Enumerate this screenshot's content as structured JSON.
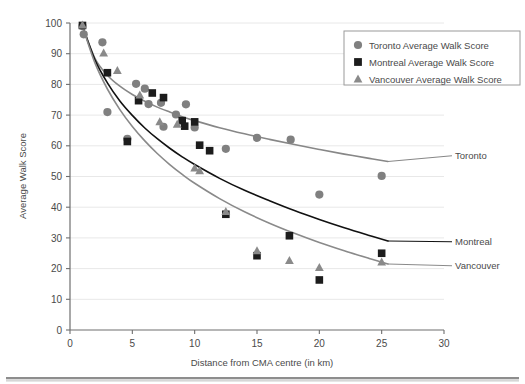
{
  "chart_data": {
    "type": "scatter",
    "title": "",
    "xlabel": "Distance from CMA centre (in km)",
    "ylabel": "Average Walk Score",
    "xlim": [
      0,
      30
    ],
    "ylim": [
      0,
      100
    ],
    "xticks": [
      0,
      5,
      10,
      15,
      20,
      25,
      30
    ],
    "yticks": [
      0,
      10,
      20,
      30,
      40,
      50,
      60,
      70,
      80,
      90,
      100
    ],
    "grid": "horizontal",
    "legend_position": "top-right",
    "legend": [
      {
        "label": "Toronto Average Walk Score",
        "marker": "circle",
        "color": "#808080"
      },
      {
        "label": "Montreal Average Walk Score",
        "marker": "square",
        "color": "#1c1c1c"
      },
      {
        "label": "Vancouver Average Walk Score",
        "marker": "triangle",
        "color": "#8a8a8a"
      }
    ],
    "series": [
      {
        "name": "Toronto Average Walk Score",
        "marker": "circle",
        "color": "#808080",
        "trend_color": "#878787",
        "end_label": "Toronto",
        "points": [
          [
            1.0,
            99.0
          ],
          [
            1.1,
            96.3
          ],
          [
            2.6,
            93.7
          ],
          [
            3.0,
            71.0
          ],
          [
            4.6,
            62.3
          ],
          [
            5.3,
            80.2
          ],
          [
            6.0,
            78.6
          ],
          [
            6.3,
            73.6
          ],
          [
            7.3,
            74.0
          ],
          [
            7.5,
            66.2
          ],
          [
            8.5,
            70.2
          ],
          [
            9.3,
            73.5
          ],
          [
            10.0,
            66.0
          ],
          [
            12.5,
            59.0
          ],
          [
            15.0,
            62.6
          ],
          [
            17.7,
            62.0
          ],
          [
            20.0,
            44.1
          ],
          [
            25.0,
            50.2
          ]
        ],
        "trend": [
          [
            1.0,
            99.0
          ],
          [
            2.0,
            88.5
          ],
          [
            3.0,
            83.0
          ],
          [
            4.0,
            79.4
          ],
          [
            5.0,
            76.7
          ],
          [
            6.0,
            74.5
          ],
          [
            7.0,
            72.6
          ],
          [
            8.0,
            71.0
          ],
          [
            9.0,
            69.5
          ],
          [
            10.0,
            68.2
          ],
          [
            12.0,
            65.9
          ],
          [
            14.0,
            63.9
          ],
          [
            16.0,
            62.1
          ],
          [
            18.0,
            60.4
          ],
          [
            20.0,
            58.8
          ],
          [
            22.0,
            57.3
          ],
          [
            24.0,
            55.9
          ],
          [
            25.5,
            54.9
          ]
        ]
      },
      {
        "name": "Montreal Average Walk Score",
        "marker": "square",
        "color": "#1c1c1c",
        "trend_color": "#111111",
        "end_label": "Montreal",
        "points": [
          [
            1.0,
            99.2
          ],
          [
            3.0,
            83.8
          ],
          [
            4.6,
            61.4
          ],
          [
            5.5,
            74.7
          ],
          [
            6.6,
            77.2
          ],
          [
            7.5,
            75.7
          ],
          [
            9.0,
            68.2
          ],
          [
            9.2,
            66.4
          ],
          [
            10.0,
            67.8
          ],
          [
            10.4,
            60.2
          ],
          [
            11.2,
            58.4
          ],
          [
            12.5,
            37.7
          ],
          [
            15.0,
            24.2
          ],
          [
            17.6,
            30.7
          ],
          [
            20.0,
            16.3
          ],
          [
            25.0,
            25.0
          ]
        ],
        "trend": [
          [
            1.0,
            99.0
          ],
          [
            2.0,
            88.0
          ],
          [
            3.0,
            80.5
          ],
          [
            4.0,
            74.6
          ],
          [
            5.0,
            69.9
          ],
          [
            6.0,
            65.8
          ],
          [
            7.0,
            62.3
          ],
          [
            8.0,
            59.2
          ],
          [
            9.0,
            56.4
          ],
          [
            10.0,
            53.9
          ],
          [
            12.0,
            49.4
          ],
          [
            14.0,
            45.5
          ],
          [
            16.0,
            42.1
          ],
          [
            18.0,
            38.9
          ],
          [
            20.0,
            36.0
          ],
          [
            22.0,
            33.3
          ],
          [
            24.0,
            30.8
          ],
          [
            25.5,
            29.0
          ]
        ]
      },
      {
        "name": "Vancouver Average Walk Score",
        "marker": "triangle",
        "color": "#8a8a8a",
        "trend_color": "#8a8a8a",
        "end_label": "Vancouver",
        "points": [
          [
            1.0,
            99.3
          ],
          [
            2.7,
            90.2
          ],
          [
            3.8,
            84.5
          ],
          [
            5.6,
            76.5
          ],
          [
            7.2,
            67.8
          ],
          [
            8.6,
            67.0
          ],
          [
            10.0,
            52.7
          ],
          [
            10.4,
            51.8
          ],
          [
            12.5,
            38.6
          ],
          [
            15.0,
            25.8
          ],
          [
            17.6,
            22.6
          ],
          [
            20.0,
            20.3
          ],
          [
            25.0,
            22.1
          ]
        ],
        "trend": [
          [
            1.0,
            99.0
          ],
          [
            2.0,
            87.0
          ],
          [
            3.0,
            78.5
          ],
          [
            4.0,
            71.8
          ],
          [
            5.0,
            66.3
          ],
          [
            6.0,
            61.6
          ],
          [
            7.0,
            57.5
          ],
          [
            8.0,
            53.9
          ],
          [
            9.0,
            50.7
          ],
          [
            10.0,
            47.8
          ],
          [
            12.0,
            42.8
          ],
          [
            14.0,
            38.5
          ],
          [
            16.0,
            34.8
          ],
          [
            18.0,
            31.5
          ],
          [
            20.0,
            28.5
          ],
          [
            22.0,
            25.8
          ],
          [
            24.0,
            23.3
          ],
          [
            25.5,
            21.5
          ]
        ]
      }
    ]
  }
}
